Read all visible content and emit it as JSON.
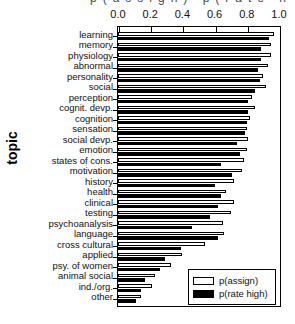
{
  "figure": {
    "y_axis_title": "topic",
    "top_partial_title_fragment": "p(assign)   p(rate high)"
  },
  "legend": {
    "position": "bottom-right-inside",
    "entries": [
      {
        "label": "p(assign)",
        "style": "open",
        "color": "#ffffff"
      },
      {
        "label": "p(rate high)",
        "style": "filled",
        "color": "#000000"
      }
    ]
  },
  "chart_data": {
    "type": "bar",
    "orientation": "horizontal",
    "title": "",
    "subtitle": "",
    "xlabel": "",
    "ylabel": "topic",
    "xlim": [
      0.0,
      1.0
    ],
    "xticks": [
      0.0,
      0.2,
      0.4,
      0.6,
      0.8,
      1.0
    ],
    "xtick_labels": [
      "0.0",
      "0.2",
      "0.4",
      "0.6",
      "0.8",
      "1.0"
    ],
    "x_axis_position": "top",
    "grid": false,
    "categories": [
      "learning",
      "memory",
      "physiology",
      "abnormal",
      "personality",
      "social",
      "perception",
      "cognit. devp.",
      "cognition",
      "sensation",
      "social devp.",
      "emotion",
      "states of cons.",
      "motivation",
      "history",
      "health",
      "clinical",
      "testing",
      "psychoanalysis",
      "language",
      "cross cultural",
      "applied",
      "psy. of women",
      "animal social",
      "ind./org.",
      "other"
    ],
    "series": [
      {
        "name": "p(assign)",
        "color": "#ffffff",
        "edgecolor": "#000000",
        "values": [
          0.97,
          0.95,
          0.95,
          0.93,
          0.9,
          0.92,
          0.83,
          0.85,
          0.82,
          0.8,
          0.81,
          0.8,
          0.78,
          0.77,
          0.72,
          0.67,
          0.72,
          0.7,
          0.65,
          0.66,
          0.54,
          0.4,
          0.33,
          0.23,
          0.21,
          0.14
        ]
      },
      {
        "name": "p(rate high)",
        "color": "#000000",
        "edgecolor": "#000000",
        "values": [
          0.94,
          0.89,
          0.89,
          0.87,
          0.88,
          0.85,
          0.81,
          0.81,
          0.8,
          0.79,
          0.74,
          0.76,
          0.64,
          0.71,
          0.6,
          0.64,
          0.62,
          0.57,
          0.46,
          0.62,
          0.39,
          0.29,
          0.26,
          0.17,
          0.14,
          0.11
        ]
      }
    ]
  }
}
